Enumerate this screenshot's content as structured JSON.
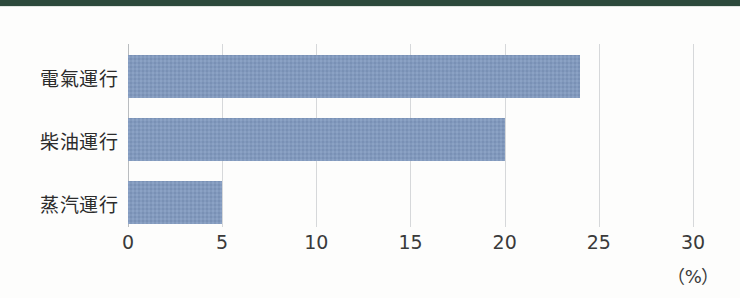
{
  "page": {
    "width": 740,
    "height": 298,
    "background_color": "#fdfdfc",
    "top_strip_color": "#2d4a3c"
  },
  "chart_data": {
    "type": "bar",
    "orientation": "horizontal",
    "title": "",
    "subtitle": "",
    "xlabel": "",
    "ylabel": "",
    "unit_label": "（%）",
    "categories": [
      "電氣運行",
      "柴油運行",
      "蒸汽運行"
    ],
    "values": [
      24,
      20,
      5
    ],
    "series": [
      {
        "name": "",
        "color": "#8099bf",
        "values": [
          24,
          20,
          5
        ]
      }
    ],
    "xlim": [
      0,
      30
    ],
    "xticks": [
      0,
      5,
      10,
      15,
      20,
      25,
      30
    ],
    "xtick_labels": [
      "0",
      "5",
      "10",
      "15",
      "20",
      "25",
      "30"
    ],
    "grid": true,
    "grid_axis": "x",
    "grid_color": "#d6d8da",
    "legend": false,
    "legend_position": "none",
    "bar_color": "#8099bf",
    "axis_color": "#b9bcbf"
  },
  "geometry": {
    "plot_left": 128,
    "plot_right": 693,
    "plot_top": 44,
    "plot_bottom": 227,
    "px_per_unit": 18.833,
    "bar_height": 43,
    "bar_tops": [
      55,
      118,
      181
    ]
  }
}
